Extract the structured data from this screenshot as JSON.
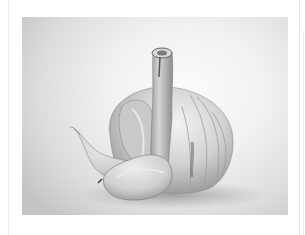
{
  "image": {
    "subject": "garlic bulb with loose cloves",
    "style": "black-and-white photograph",
    "alt": "Black and white photo of a garlic bulb with two separated cloves",
    "colors": {
      "page_background": "#ffffff",
      "photo_highlight": "#fbfbfb",
      "photo_shadow": "#c4c4c4",
      "garlic_mid": "#bdbdbd",
      "garlic_dark": "#6e6e6e"
    }
  }
}
